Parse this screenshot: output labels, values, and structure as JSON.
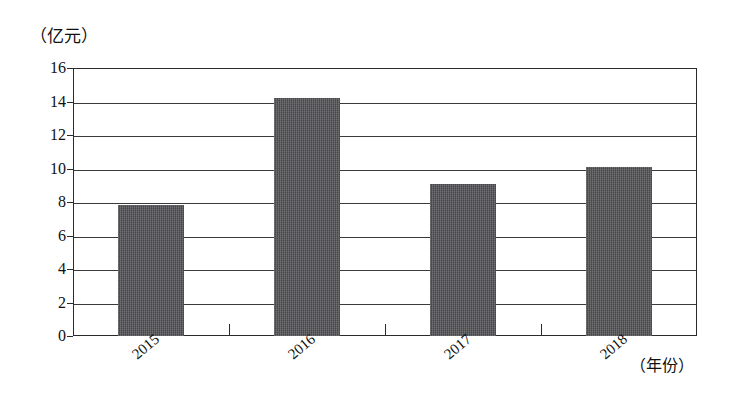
{
  "chart_data": {
    "type": "bar",
    "title": "",
    "subtitle": "",
    "xlabel": "（年份）",
    "ylabel": "（亿元）",
    "categories": [
      "2015",
      "2016",
      "2017",
      "2018"
    ],
    "values": [
      7.8,
      14.2,
      9.05,
      10.1
    ],
    "series": [
      {
        "name": "",
        "values": [
          7.8,
          14.2,
          9.05,
          10.1
        ]
      }
    ],
    "ylim": [
      0,
      16
    ],
    "ytick_step": 2,
    "ytick_labels": [
      "0",
      "2",
      "4",
      "6",
      "8",
      "10",
      "12",
      "14",
      "16"
    ],
    "grid": true,
    "grid_axis": "y",
    "legend": false,
    "legend_position": "none",
    "bar_color": "#56565a",
    "axis_color": "#2b2b2b",
    "background_color": "#ffffff",
    "xtick_label_rotation": -40
  },
  "axes": {
    "y_unit_caption": "（亿元）",
    "x_unit_caption": "（年份）"
  }
}
